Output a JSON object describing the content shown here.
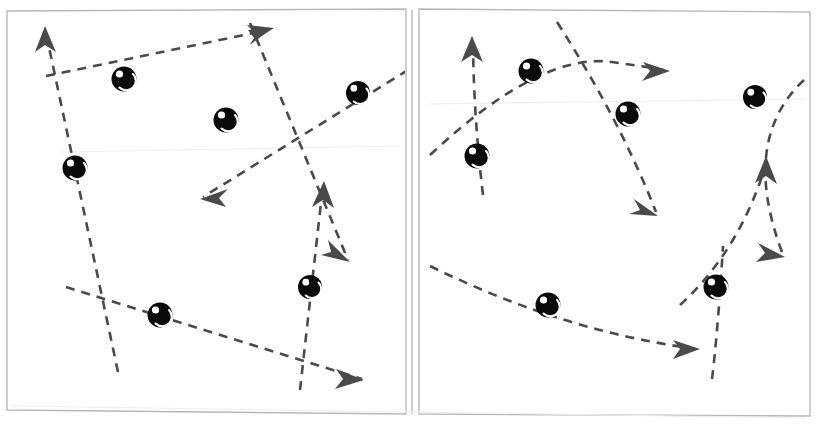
{
  "figure": {
    "width": 817,
    "height": 424,
    "background_color": "#ffffff",
    "frame_color": "#b9b9b9",
    "stroke_color": "#4a4a4a",
    "node_color": "#0a0a0a",
    "node_highlight_color": "#ffffff",
    "dash_pattern": "9 7",
    "stroke_width": 2.6
  },
  "panels": [
    {
      "id": "panel-left",
      "name": "left-panel",
      "geometry": {
        "x": 6,
        "y": 8,
        "width": 400,
        "height": 408
      },
      "path_style": "straight",
      "node_count": 7,
      "path_count": 5,
      "arrow_count": 5,
      "nodes": [
        {
          "id": "L1",
          "cx": 124,
          "cy": 79,
          "r": 12
        },
        {
          "id": "L2",
          "cx": 226,
          "cy": 120,
          "r": 12
        },
        {
          "id": "L3",
          "cx": 358,
          "cy": 93,
          "r": 12
        },
        {
          "id": "L4",
          "cx": 75,
          "cy": 168,
          "r": 12
        },
        {
          "id": "L5",
          "cx": 160,
          "cy": 315,
          "r": 12
        },
        {
          "id": "L6",
          "cx": 310,
          "cy": 287,
          "r": 12
        },
        {
          "id": "L7",
          "cx": 310,
          "cy": 287,
          "r": 0
        }
      ],
      "paths": [
        {
          "id": "L-path-1",
          "label": "upper-left-to-upper-right-ray",
          "d": "M 46 76 L 268 30",
          "arrow": {
            "x": 268,
            "y": 30,
            "angle": -11
          }
        },
        {
          "id": "L-path-2",
          "label": "steep-upward-left-ray",
          "d": "M 118 372 L 46 33",
          "arrow": {
            "x": 46,
            "y": 33,
            "angle": -102
          }
        },
        {
          "id": "L-path-3",
          "label": "descending-right-ray",
          "d": "M 250 23 L 348 260",
          "arrow": {
            "x": 348,
            "y": 260,
            "angle": 67
          }
        },
        {
          "id": "L-path-4",
          "label": "leftward-descending-ray",
          "d": "M 408 70 L 203 197",
          "arrow": {
            "x": 203,
            "y": 197,
            "angle": 149
          }
        },
        {
          "id": "L-path-5",
          "label": "lower-rightward-ray",
          "d": "M 66 287 L 362 379",
          "arrow": {
            "x": 362,
            "y": 379,
            "angle": 17
          }
        },
        {
          "id": "L-path-6",
          "label": "short-vertical-up-ray",
          "d": "M 300 390 L 323 185",
          "arrow": {
            "x": 323,
            "y": 185,
            "angle": -84
          }
        }
      ]
    },
    {
      "id": "panel-right",
      "name": "right-panel",
      "geometry": {
        "x": 418,
        "y": 8,
        "width": 393,
        "height": 408
      },
      "path_style": "curved",
      "node_count": 6,
      "path_count": 5,
      "arrow_count": 5,
      "nodes": [
        {
          "id": "R1",
          "cx": 531,
          "cy": 71,
          "r": 12
        },
        {
          "id": "R2",
          "cx": 628,
          "cy": 114,
          "r": 12
        },
        {
          "id": "R3",
          "cx": 755,
          "cy": 97,
          "r": 12
        },
        {
          "id": "R4",
          "cx": 477,
          "cy": 156,
          "r": 12
        },
        {
          "id": "R5",
          "cx": 548,
          "cy": 305,
          "r": 12
        },
        {
          "id": "R6",
          "cx": 716,
          "cy": 287,
          "r": 12
        }
      ],
      "paths": [
        {
          "id": "R-path-1",
          "label": "upper-arc-to-right",
          "d": "M 430 155 Q 540 52 612 62 Q 655 68 664 70",
          "arrow": {
            "x": 666,
            "y": 70,
            "angle": 14
          }
        },
        {
          "id": "R-path-2",
          "label": "left-vertical-up-arc",
          "d": "M 483 195 Q 474 120 473 46",
          "arrow": {
            "x": 473,
            "y": 42,
            "angle": -89
          }
        },
        {
          "id": "R-path-3",
          "label": "descending-curve-to-lower-left",
          "d": "M 557 22 Q 620 120 656 212",
          "arrow": {
            "x": 658,
            "y": 218,
            "angle": 70
          }
        },
        {
          "id": "R-path-4",
          "label": "descending-curve-to-lower-right",
          "d": "M 804 80 Q 740 140 782 252",
          "arrow": {
            "x": 784,
            "y": 258,
            "angle": 72
          }
        },
        {
          "id": "R-path-5",
          "label": "rising-curve-to-upper-right",
          "d": "M 680 305 Q 740 250 766 164",
          "arrow": {
            "x": 768,
            "y": 158,
            "angle": -72
          }
        },
        {
          "id": "R-path-6",
          "label": "lower-arc-to-right",
          "d": "M 430 266 Q 560 330 690 348",
          "arrow": {
            "x": 696,
            "y": 349,
            "angle": 7
          }
        },
        {
          "id": "R-path-7",
          "label": "vertical-tail-through-lower-node",
          "d": "M 712 379 Q 718 330 723 246",
          "arrow": null
        }
      ]
    }
  ],
  "legend": {
    "node_label": "state node",
    "path_label": "directed flow",
    "visible": false
  }
}
